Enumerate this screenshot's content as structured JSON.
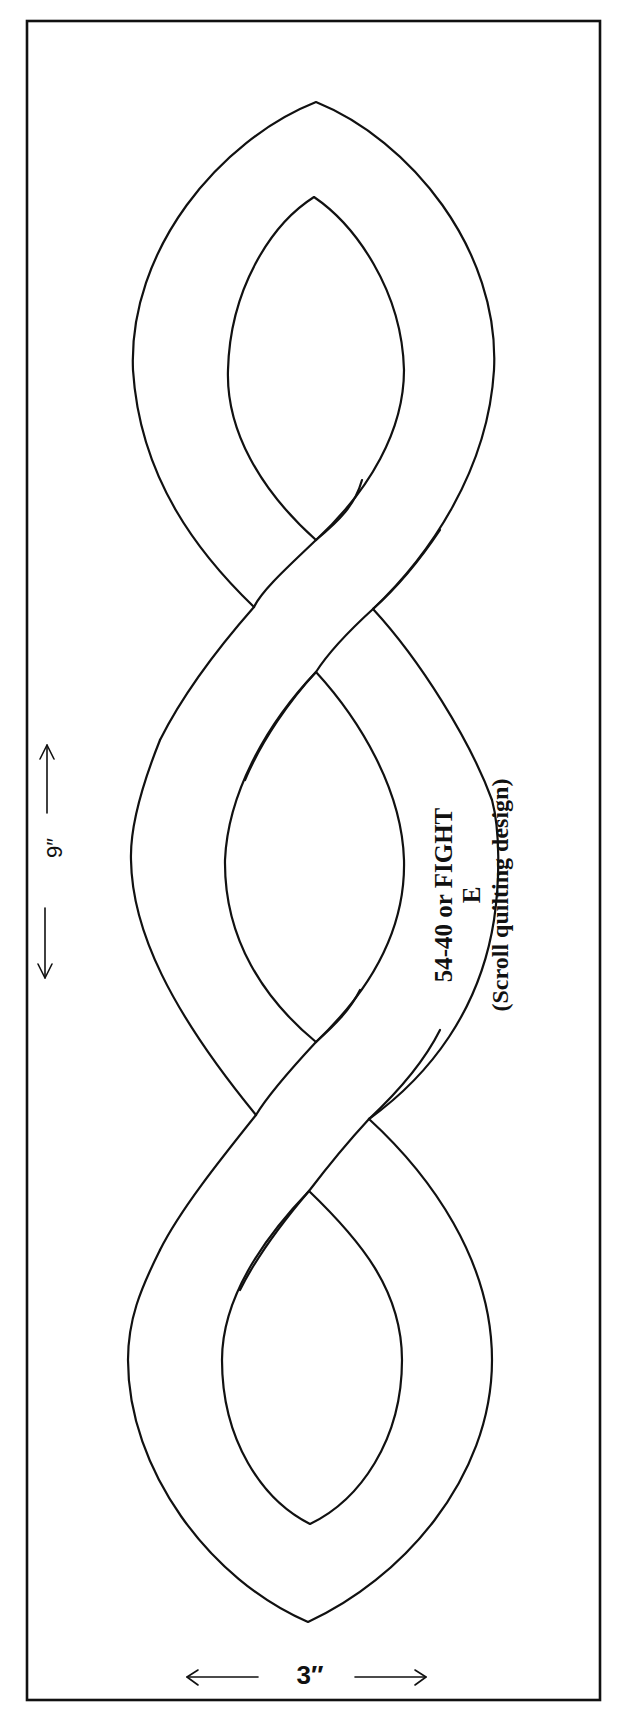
{
  "diagram": {
    "title": "54-40 or FIGHT",
    "pattern_letter": "E",
    "subtitle": "(Scroll quilting design)",
    "dimensions": {
      "height_label": "9″",
      "width_label": "3″"
    },
    "motif": "scroll",
    "lobes": 3,
    "crossings": 2
  },
  "colors": {
    "ink": "#111111",
    "paper": "#ffffff"
  }
}
